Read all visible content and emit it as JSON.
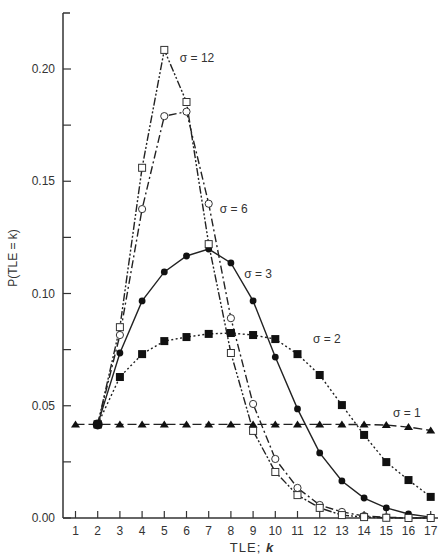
{
  "chart_data": {
    "type": "line",
    "title": "",
    "xlabel": "TLE; k",
    "ylabel": "P(TLE = k)",
    "x": [
      1,
      2,
      3,
      4,
      5,
      6,
      7,
      8,
      9,
      10,
      11,
      12,
      13,
      14,
      15,
      16,
      17
    ],
    "xticks": [
      "1",
      "2",
      "3",
      "4",
      "5",
      "6",
      "7",
      "8",
      "9",
      "10",
      "11",
      "12",
      "13",
      "14",
      "15",
      "16",
      "17"
    ],
    "yticks": [
      "0.00",
      "0.05",
      "0.10",
      "0.15",
      "0.20"
    ],
    "ylim": [
      0,
      0.22
    ],
    "grid": false,
    "legend": "inline annotations",
    "series": [
      {
        "name": "σ = 1",
        "marker": "filled-triangle",
        "line": "dashed",
        "values": [
          0.0417,
          0.0417,
          0.0417,
          0.0417,
          0.0417,
          0.0417,
          0.0417,
          0.0417,
          0.0417,
          0.0417,
          0.0417,
          0.0417,
          0.0417,
          0.0416,
          0.0414,
          0.0405,
          0.039
        ]
      },
      {
        "name": "σ = 2",
        "marker": "filled-square",
        "line": "dotted",
        "values": [
          null,
          0.0417,
          0.0628,
          0.073,
          0.0788,
          0.0806,
          0.082,
          0.0824,
          0.0815,
          0.0797,
          0.073,
          0.0637,
          0.0503,
          0.037,
          0.0249,
          0.0169,
          0.0094
        ]
      },
      {
        "name": "σ = 3",
        "marker": "filled-circle",
        "line": "solid",
        "values": [
          null,
          0.0417,
          0.0735,
          0.0967,
          0.1096,
          0.1167,
          0.1198,
          0.1136,
          0.0967,
          0.0717,
          0.0486,
          0.029,
          0.0165,
          0.0089,
          0.0045,
          0.0018,
          0.0004
        ]
      },
      {
        "name": "σ = 6",
        "marker": "open-circle",
        "line": "dash-dot",
        "values": [
          null,
          0.0417,
          0.0815,
          0.1376,
          0.179,
          0.181,
          0.14,
          0.089,
          0.0508,
          0.0263,
          0.0134,
          0.0058,
          0.0027,
          0.0009,
          0.0003,
          0.0001,
          0.0
        ]
      },
      {
        "name": "σ = 12",
        "marker": "open-square",
        "line": "dash-dot-dot",
        "values": [
          null,
          0.0417,
          0.085,
          0.156,
          0.2085,
          0.1853,
          0.122,
          0.0735,
          0.0388,
          0.0205,
          0.0102,
          0.0045,
          0.0013,
          0.0004,
          0.0001,
          0.0,
          0.0
        ]
      }
    ],
    "annotations": [
      {
        "text": "σ = 12",
        "x": 5.7,
        "y": 0.203
      },
      {
        "text": "σ = 6",
        "x": 7.5,
        "y": 0.136
      },
      {
        "text": "σ = 3",
        "x": 8.6,
        "y": 0.107
      },
      {
        "text": "σ = 2",
        "x": 11.7,
        "y": 0.078
      },
      {
        "text": "σ = 1",
        "x": 15.3,
        "y": 0.045
      }
    ]
  },
  "labels": {
    "xlabel_main": "TLE;",
    "xlabel_var": "k",
    "ylabel": "P(TLE = k)"
  }
}
